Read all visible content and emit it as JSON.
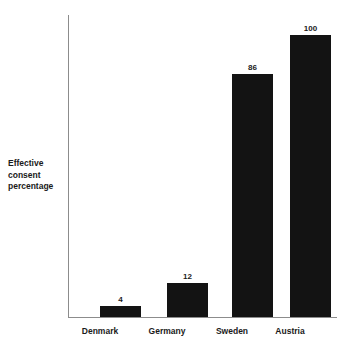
{
  "chart_data": {
    "type": "bar",
    "title": "",
    "subtitle": "",
    "xlabel": "",
    "ylabel": "Effective consent percentage",
    "categories": [
      "Denmark",
      "Germany",
      "Sweden",
      "Austria"
    ],
    "values": [
      4,
      12,
      86,
      100
    ],
    "value_labels": [
      "4",
      "12",
      "86",
      "100"
    ],
    "ylim": [
      0,
      107
    ],
    "grid": false,
    "legend": false,
    "legend_position": "none",
    "series": [
      {
        "name": "Effective consent percentage",
        "values": [
          4,
          12,
          86,
          100
        ]
      }
    ],
    "annotations": [],
    "tick_labels": {
      "x": [
        "Denmark",
        "Germany",
        "Sweden",
        "Austria"
      ],
      "y": []
    },
    "colors": {
      "bar": "#131313",
      "axis": "#8c8c8c",
      "text": "#1a1a1a",
      "background": "#ffffff"
    }
  },
  "axis": {
    "y_title_line1": "Effective",
    "y_title_line2": "consent",
    "y_title_line3": "percentage"
  }
}
